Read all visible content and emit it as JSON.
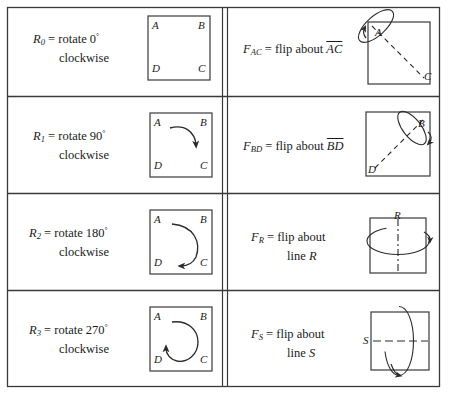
{
  "figure": {
    "type": "table",
    "columns": 2,
    "rows": 4,
    "stroke_color": "#3a3a3a",
    "background_color": "#ffffff"
  },
  "rotations": [
    {
      "id": "R0",
      "symbol": "R",
      "subscript": "0",
      "equals": "=",
      "description_line1": "rotate 0",
      "degree": "°",
      "description_line2": "clockwise",
      "diagram": {
        "kind": "square-with-vertices",
        "vertices": {
          "top_left": "A",
          "top_right": "B",
          "bottom_right": "C",
          "bottom_left": "D"
        },
        "arrow": "none"
      }
    },
    {
      "id": "R1",
      "symbol": "R",
      "subscript": "1",
      "equals": "=",
      "description_line1": "rotate 90",
      "degree": "°",
      "description_line2": "clockwise",
      "diagram": {
        "kind": "square-with-vertices",
        "vertices": {
          "top_left": "A",
          "top_right": "B",
          "bottom_right": "C",
          "bottom_left": "D"
        },
        "arrow": "quarter-arc-clockwise"
      }
    },
    {
      "id": "R2",
      "symbol": "R",
      "subscript": "2",
      "equals": "=",
      "description_line1": "rotate 180",
      "degree": "°",
      "description_line2": "clockwise",
      "diagram": {
        "kind": "square-with-vertices",
        "vertices": {
          "top_left": "A",
          "top_right": "B",
          "bottom_right": "C",
          "bottom_left": "D"
        },
        "arrow": "half-arc-clockwise"
      }
    },
    {
      "id": "R3",
      "symbol": "R",
      "subscript": "3",
      "equals": "=",
      "description_line1": "rotate 270",
      "degree": "°",
      "description_line2": "clockwise",
      "diagram": {
        "kind": "square-with-vertices",
        "vertices": {
          "top_left": "A",
          "top_right": "B",
          "bottom_right": "C",
          "bottom_left": "D"
        },
        "arrow": "three-quarter-arc-clockwise"
      }
    }
  ],
  "flips": [
    {
      "id": "FAC",
      "symbol": "F",
      "subscript": "AC",
      "equals": "=",
      "description": "flip about",
      "axis_label": "AC",
      "axis_overline": true,
      "diagram": {
        "kind": "square-with-diagonal-axis",
        "axis_from": "A",
        "axis_to": "C",
        "axis_corners": {
          "start": "top-left",
          "end": "bottom-right"
        },
        "labels": {
          "start": "A",
          "end": "C"
        },
        "revolution_ellipse": "tilted-around-A-corner"
      }
    },
    {
      "id": "FBD",
      "symbol": "F",
      "subscript": "BD",
      "equals": "=",
      "description": "flip about",
      "axis_label": "BD",
      "axis_overline": true,
      "diagram": {
        "kind": "square-with-diagonal-axis",
        "axis_from": "B",
        "axis_to": "D",
        "axis_corners": {
          "start": "top-right",
          "end": "bottom-left"
        },
        "labels": {
          "start": "B",
          "end": "D"
        },
        "revolution_ellipse": "tilted-around-B-corner"
      }
    },
    {
      "id": "FR",
      "symbol": "F",
      "subscript": "R",
      "equals": "=",
      "description": "flip about",
      "description_line2": "line",
      "axis_label": "R",
      "axis_overline": false,
      "diagram": {
        "kind": "square-with-vertical-axis",
        "axis_label": "R",
        "axis_orientation": "vertical",
        "axis_style": "dash-dot",
        "revolution_ellipse": "horizontal-around-vertical-axis"
      }
    },
    {
      "id": "FS",
      "symbol": "F",
      "subscript": "S",
      "equals": "=",
      "description": "flip about",
      "description_line2": "line",
      "axis_label": "S",
      "axis_overline": false,
      "diagram": {
        "kind": "square-with-horizontal-axis",
        "axis_label": "S",
        "axis_orientation": "horizontal",
        "axis_style": "dash-dot",
        "revolution_ellipse": "vertical-around-horizontal-axis"
      }
    }
  ]
}
